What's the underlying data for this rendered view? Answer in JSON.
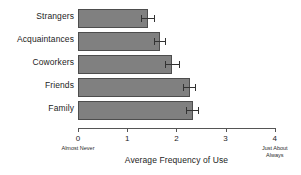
{
  "chart_data": {
    "type": "bar",
    "orientation": "horizontal",
    "title": "",
    "xlabel": "Average Frequency of Use",
    "ylabel": "",
    "xlim": [
      0,
      4
    ],
    "xticks": [
      0,
      1,
      2,
      3,
      4
    ],
    "xtick_labels": [
      "0",
      "1",
      "2",
      "3",
      "4"
    ],
    "grid": false,
    "legend": null,
    "bar_color": "#808080",
    "bar_edge_color": "#4d4d4d",
    "categories": [
      "Strangers",
      "Acquaintances",
      "Coworkers",
      "Friends",
      "Family"
    ],
    "values": [
      1.43,
      1.67,
      1.92,
      2.27,
      2.33
    ],
    "errors": [
      0.14,
      0.12,
      0.15,
      0.13,
      0.13
    ],
    "anchors": [
      {
        "at_tick": 0,
        "text": "Almost Never"
      },
      {
        "at_tick": 4,
        "text": "Just About Always"
      }
    ]
  },
  "axis": {
    "title": "Average Frequency of Use",
    "anchor_low": "Almost Never",
    "anchor_high_line1": "Just About",
    "anchor_high_line2": "Always",
    "ticks": [
      "0",
      "1",
      "2",
      "3",
      "4"
    ]
  },
  "bars": [
    {
      "label": "Strangers",
      "value": 1.43,
      "error": 0.14
    },
    {
      "label": "Acquaintances",
      "value": 1.67,
      "error": 0.12
    },
    {
      "label": "Coworkers",
      "value": 1.92,
      "error": 0.15
    },
    {
      "label": "Friends",
      "value": 2.27,
      "error": 0.13
    },
    {
      "label": "Family",
      "value": 2.33,
      "error": 0.13
    }
  ]
}
